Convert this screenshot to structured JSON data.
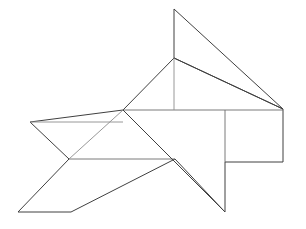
{
  "figure": {
    "title": "Tangram line drawing",
    "canvas": {
      "width": 306,
      "height": 229,
      "background": "#ffffff"
    },
    "style": {
      "outline_color": "#404040",
      "inner_color": "#6b6b6b",
      "inner_light_color": "#8c8c8c",
      "stroke_width": 1
    },
    "vertices": {
      "top_apex": [
        174,
        9
      ],
      "right_corner": [
        283,
        109
      ],
      "fin_base_left": [
        123,
        110
      ],
      "neck": [
        174,
        58
      ],
      "left_point": [
        30,
        122
      ],
      "notch": [
        69,
        159
      ],
      "bottom_left": [
        18,
        212
      ],
      "bottom_mid": [
        71,
        212
      ],
      "tail_tip": [
        225,
        212
      ],
      "rect_bottom_left": [
        225,
        162
      ],
      "rect_bottom_right": [
        283,
        162
      ],
      "mid_right": [
        175,
        159
      ],
      "inner_div_x": [
        225,
        110
      ]
    },
    "segments": [
      {
        "name": "apex-to-right",
        "from": [
          174,
          9
        ],
        "to": [
          283,
          109
        ],
        "weight": "outline"
      },
      {
        "name": "apex-down-to-neck",
        "from": [
          174,
          9
        ],
        "to": [
          174,
          58
        ],
        "weight": "outline"
      },
      {
        "name": "neck-to-fin-base",
        "from": [
          174,
          58
        ],
        "to": [
          123,
          110
        ],
        "weight": "outline"
      },
      {
        "name": "neck-vertical-inner",
        "from": [
          174,
          58
        ],
        "to": [
          174,
          110
        ],
        "weight": "inner-light"
      },
      {
        "name": "top-horizontal",
        "from": [
          123,
          110
        ],
        "to": [
          283,
          110
        ],
        "weight": "inner"
      },
      {
        "name": "right-vertical",
        "from": [
          283,
          109
        ],
        "to": [
          283,
          162
        ],
        "weight": "outline"
      },
      {
        "name": "rect-bottom",
        "from": [
          283,
          162
        ],
        "to": [
          225,
          162
        ],
        "weight": "outline"
      },
      {
        "name": "rect-inner-vertical",
        "from": [
          225,
          110
        ],
        "to": [
          225,
          162
        ],
        "weight": "inner"
      },
      {
        "name": "tail-vertical",
        "from": [
          225,
          162
        ],
        "to": [
          225,
          212
        ],
        "weight": "outline"
      },
      {
        "name": "tail-diagonal",
        "from": [
          225,
          212
        ],
        "to": [
          123,
          110
        ],
        "weight": "outline"
      },
      {
        "name": "mid-horizontal",
        "from": [
          69,
          159
        ],
        "to": [
          175,
          159
        ],
        "weight": "inner"
      },
      {
        "name": "left-top-edge",
        "from": [
          30,
          122
        ],
        "to": [
          123,
          122
        ],
        "weight": "outline"
      },
      {
        "name": "left-point-to-notch",
        "from": [
          30,
          122
        ],
        "to": [
          69,
          159
        ],
        "weight": "outline"
      },
      {
        "name": "notch-to-bottom-left",
        "from": [
          69,
          159
        ],
        "to": [
          18,
          212
        ],
        "weight": "outline"
      },
      {
        "name": "bottom-edge",
        "from": [
          18,
          212
        ],
        "to": [
          71,
          212
        ],
        "weight": "outline"
      },
      {
        "name": "bottom-mid-to-mid-right",
        "from": [
          71,
          212
        ],
        "to": [
          175,
          159
        ],
        "weight": "outline"
      },
      {
        "name": "notch-diagonal-up",
        "from": [
          69,
          159
        ],
        "to": [
          123,
          110
        ],
        "weight": "inner-light"
      }
    ],
    "shape_count": 7
  }
}
